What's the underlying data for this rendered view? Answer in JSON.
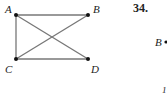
{
  "diagram": {
    "nodes": [
      {
        "id": "A",
        "label": "A",
        "x": 16,
        "y": 15
      },
      {
        "id": "B",
        "label": "B",
        "x": 88,
        "y": 15
      },
      {
        "id": "C",
        "label": "C",
        "x": 16,
        "y": 59
      },
      {
        "id": "D",
        "label": "D",
        "x": 88,
        "y": 59
      }
    ],
    "edges": [
      [
        "A",
        "B"
      ],
      [
        "A",
        "C"
      ],
      [
        "A",
        "D"
      ],
      [
        "B",
        "C"
      ],
      [
        "C",
        "D"
      ]
    ],
    "edge_color": "#777777",
    "node_color": "#111111"
  },
  "problem": {
    "number": "34.",
    "partial_label_b": "B",
    "partial_label_bottom": "1"
  }
}
